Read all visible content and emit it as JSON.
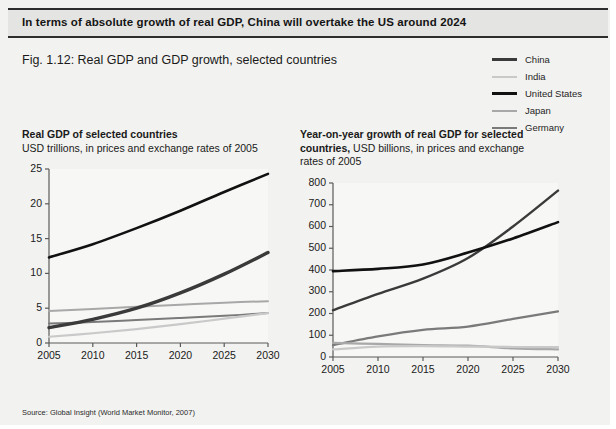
{
  "banner": {
    "text": "In terms of absolute growth of real GDP, China will overtake the US around 2024"
  },
  "figure": {
    "title": "Fig. 1.12: Real GDP and GDP growth, selected countries",
    "source_label": "Source:",
    "source_text": "Global Insight (World Market Monitor, 2007)"
  },
  "legend": {
    "items": [
      {
        "label": "China",
        "color": "#3a3a3a",
        "width": 3.2
      },
      {
        "label": "India",
        "color": "#c9c9c9",
        "width": 2.2
      },
      {
        "label": "United States",
        "color": "#111111",
        "width": 3.0
      },
      {
        "label": "Japan",
        "color": "#a8a8a8",
        "width": 2.2
      },
      {
        "label": "Germany",
        "color": "#7a7a7a",
        "width": 2.2
      }
    ]
  },
  "chart_data": [
    {
      "id": "real-gdp",
      "type": "line",
      "title": "Real GDP of selected countries",
      "subtitle": "USD trillions, in prices and exchange rates of 2005",
      "xlabel": "",
      "ylabel": "",
      "x": [
        2005,
        2010,
        2015,
        2020,
        2025,
        2030
      ],
      "xlim": [
        2005,
        2030
      ],
      "ylim": [
        0,
        25
      ],
      "yticks": [
        0,
        5,
        10,
        15,
        20,
        25
      ],
      "xticks": [
        2005,
        2010,
        2015,
        2020,
        2025,
        2030
      ],
      "grid": false,
      "legend_position": "top-right-shared",
      "series": [
        {
          "name": "United States",
          "color": "#111111",
          "width": 2.6,
          "values": [
            12.3,
            14.2,
            16.5,
            19.0,
            21.7,
            24.3
          ]
        },
        {
          "name": "China",
          "color": "#3a3a3a",
          "width": 3.4,
          "values": [
            2.2,
            3.4,
            5.0,
            7.2,
            9.9,
            13.0
          ]
        },
        {
          "name": "Japan",
          "color": "#a8a8a8",
          "width": 2.0,
          "values": [
            4.6,
            4.9,
            5.2,
            5.5,
            5.8,
            6.0
          ]
        },
        {
          "name": "Germany",
          "color": "#7a7a7a",
          "width": 2.0,
          "values": [
            2.8,
            3.0,
            3.3,
            3.6,
            3.9,
            4.3
          ]
        },
        {
          "name": "India",
          "color": "#c9c9c9",
          "width": 2.2,
          "values": [
            0.9,
            1.4,
            2.0,
            2.7,
            3.5,
            4.3
          ]
        }
      ]
    },
    {
      "id": "gdp-growth",
      "type": "line",
      "title": "Year-on-year growth of real GDP for selected countries,",
      "subtitle": "USD billions, in prices and exchange rates of 2005",
      "xlabel": "",
      "ylabel": "",
      "x": [
        2005,
        2010,
        2015,
        2020,
        2025,
        2030
      ],
      "xlim": [
        2005,
        2030
      ],
      "ylim": [
        0,
        800
      ],
      "yticks": [
        0,
        100,
        200,
        300,
        400,
        500,
        600,
        700,
        800
      ],
      "xticks": [
        2005,
        2010,
        2015,
        2020,
        2025,
        2030
      ],
      "grid": false,
      "legend_position": "top-right-shared",
      "series": [
        {
          "name": "United States",
          "color": "#111111",
          "width": 2.6,
          "values": [
            395,
            405,
            425,
            480,
            545,
            620
          ]
        },
        {
          "name": "China",
          "color": "#3a3a3a",
          "width": 2.4,
          "values": [
            215,
            290,
            360,
            455,
            600,
            765
          ]
        },
        {
          "name": "India",
          "color": "#7a7a7a",
          "width": 2.2,
          "values": [
            55,
            95,
            125,
            140,
            175,
            210
          ]
        },
        {
          "name": "Japan",
          "color": "#a8a8a8",
          "width": 2.2,
          "values": [
            65,
            60,
            55,
            52,
            40,
            35
          ]
        },
        {
          "name": "Germany",
          "color": "#c9c9c9",
          "width": 2.2,
          "values": [
            35,
            48,
            50,
            48,
            46,
            45
          ]
        }
      ]
    }
  ]
}
